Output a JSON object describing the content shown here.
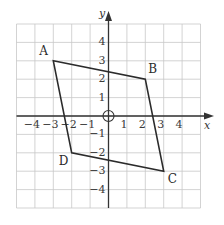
{
  "diagram": {
    "type": "coordinate-grid-quadrilateral",
    "axes": {
      "x_label": "x",
      "y_label": "y",
      "x_range": [
        -5,
        5
      ],
      "y_range": [
        -5,
        5
      ],
      "x_ticks": [
        {
          "value": -4,
          "label": "−4"
        },
        {
          "value": -3,
          "label": "−3"
        },
        {
          "value": -2,
          "label": "−2"
        },
        {
          "value": -1,
          "label": "−1"
        },
        {
          "value": 1,
          "label": "1"
        },
        {
          "value": 2,
          "label": "2"
        },
        {
          "value": 3,
          "label": "3"
        },
        {
          "value": 4,
          "label": "4"
        }
      ],
      "y_ticks": [
        {
          "value": 4,
          "label": "4"
        },
        {
          "value": 3,
          "label": "3"
        },
        {
          "value": 2,
          "label": "2"
        },
        {
          "value": 1,
          "label": "1"
        },
        {
          "value": -1,
          "label": "−1"
        },
        {
          "value": -2,
          "label": "−2"
        },
        {
          "value": -3,
          "label": "−3"
        },
        {
          "value": -4,
          "label": "−4"
        }
      ],
      "origin_marker": "circle"
    },
    "vertices": [
      {
        "name": "A",
        "x": -3,
        "y": 3
      },
      {
        "name": "B",
        "x": 2,
        "y": 2
      },
      {
        "name": "C",
        "x": 3,
        "y": -3
      },
      {
        "name": "D",
        "x": -2,
        "y": -2
      }
    ],
    "colors": {
      "grid": "#c8c8c8",
      "axis": "#333333",
      "shape": "#2b2b2b",
      "background": "#ffffff"
    }
  }
}
